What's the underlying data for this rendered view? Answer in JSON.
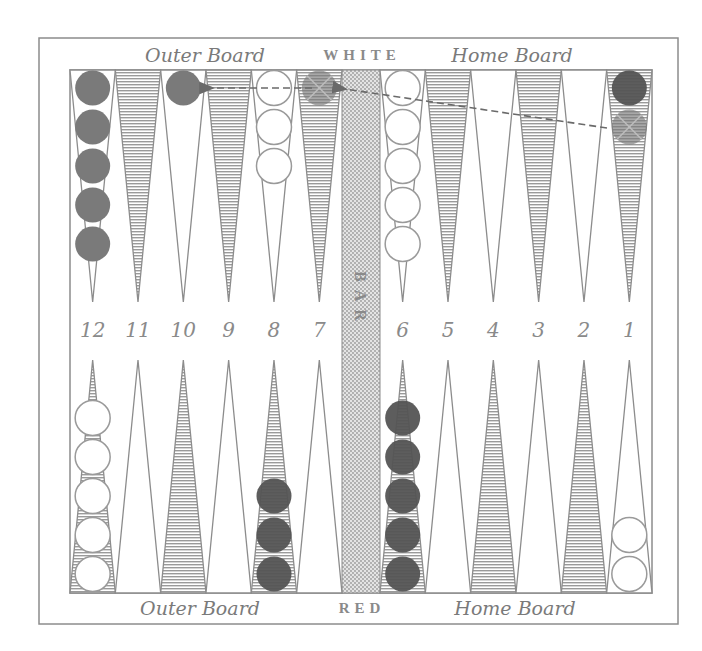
{
  "board": {
    "top_player": "WHITE",
    "bottom_player": "RED",
    "bar_label": "BAR",
    "top_left_label": "Outer Board",
    "top_right_label": "Home Board",
    "bottom_left_label": "Outer Board",
    "bottom_right_label": "Home Board"
  },
  "point_numbers": [
    "12",
    "11",
    "10",
    "9",
    "8",
    "7",
    "6",
    "5",
    "4",
    "3",
    "2",
    "1"
  ],
  "colors": {
    "frame": "#8c8c8c",
    "shaded_point": "#9a9a9a",
    "red_checker": "#7a7a7a",
    "red_checker_dark": "#545454",
    "white_checker": "#ffffff",
    "white_outline": "#9a9a9a",
    "arrow": "#6a6a6a"
  },
  "checkers": {
    "top": [
      {
        "point": "12",
        "color": "red",
        "count": 5
      },
      {
        "point": "10",
        "color": "red",
        "count": 1
      },
      {
        "point": "8",
        "color": "white",
        "count": 3
      },
      {
        "point": "7",
        "color": "red-ghost",
        "count": 1,
        "marked": "x"
      },
      {
        "point": "6",
        "color": "white",
        "count": 5
      },
      {
        "point": "1",
        "color": "red-dark",
        "count": 1
      },
      {
        "point": "1",
        "color": "red-ghost",
        "count": 1,
        "marked": "x"
      }
    ],
    "bottom": [
      {
        "point": "12",
        "color": "white",
        "count": 5
      },
      {
        "point": "8",
        "color": "red-dark",
        "count": 3
      },
      {
        "point": "6",
        "color": "red-dark",
        "count": 5
      },
      {
        "point": "1",
        "color": "white",
        "count": 2
      }
    ]
  },
  "moves": [
    {
      "from": "1",
      "to": "bar-edge-7",
      "style": "dashed-arrow"
    },
    {
      "from": "7",
      "to": "10",
      "style": "dashed-arrow"
    }
  ]
}
